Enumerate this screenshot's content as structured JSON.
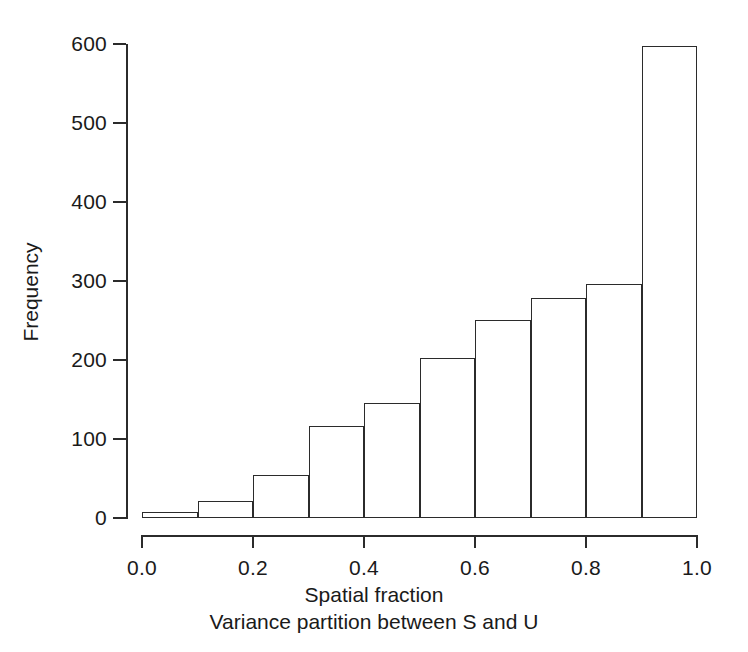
{
  "chart_data": {
    "type": "bar",
    "title": "",
    "subtitle": "",
    "xlabel": "Spatial fraction",
    "xsublabel": "Variance partition between S and U",
    "ylabel": "Frequency",
    "grid": false,
    "legend": null,
    "xlim": [
      0.0,
      1.0
    ],
    "ylim": [
      0,
      600
    ],
    "xticks": [
      "0.0",
      "0.2",
      "0.4",
      "0.6",
      "0.8",
      "1.0"
    ],
    "xtick_values": [
      0.0,
      0.2,
      0.4,
      0.6,
      0.8,
      1.0
    ],
    "yticks": [
      "0",
      "100",
      "200",
      "300",
      "400",
      "500",
      "600"
    ],
    "ytick_values": [
      0,
      100,
      200,
      300,
      400,
      500,
      600
    ],
    "bin_width": 0.1,
    "bin_edges": [
      0.0,
      0.1,
      0.2,
      0.3,
      0.4,
      0.5,
      0.6,
      0.7,
      0.8,
      0.9,
      1.0
    ],
    "categories": [
      "0.0-0.1",
      "0.1-0.2",
      "0.2-0.3",
      "0.3-0.4",
      "0.4-0.5",
      "0.5-0.6",
      "0.6-0.7",
      "0.7-0.8",
      "0.8-0.9",
      "0.9-1.0"
    ],
    "values": [
      8,
      22,
      55,
      117,
      145,
      203,
      251,
      279,
      296,
      598
    ],
    "bar_fill": "#ffffff",
    "bar_stroke": "#2b2b2b",
    "axis_color": "#2b2b2b",
    "background": "#ffffff"
  }
}
